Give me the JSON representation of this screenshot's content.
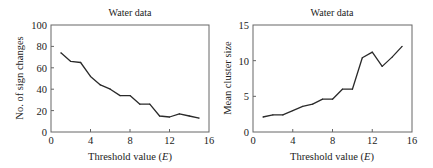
{
  "chart_data": [
    {
      "type": "line",
      "title": "Water data",
      "xlabel": "Threshold value (E)",
      "xlabel_parts": {
        "prefix": "Threshold value (",
        "var": "E",
        "suffix": ")"
      },
      "ylabel": "No. of sign changes",
      "xlim": [
        0,
        16
      ],
      "ylim": [
        0,
        100
      ],
      "xticks": [
        0,
        4,
        8,
        12,
        16
      ],
      "xtick_labels": [
        "0",
        "4",
        "8",
        "12",
        "16"
      ],
      "yticks": [
        0,
        20,
        40,
        60,
        80,
        100
      ],
      "ytick_labels": [
        "0",
        "20",
        "40",
        "60",
        "80",
        "100"
      ],
      "grid": false,
      "x": [
        1,
        2,
        3,
        4,
        5,
        6,
        7,
        8,
        9,
        10,
        11,
        12,
        13,
        14,
        15
      ],
      "series": [
        {
          "name": "No. of sign changes",
          "values": [
            74,
            66,
            65,
            52,
            44,
            40,
            34,
            34,
            26,
            26,
            15,
            14,
            17,
            15,
            13
          ]
        }
      ]
    },
    {
      "type": "line",
      "title": "Water data",
      "xlabel": "Threshold value (E)",
      "xlabel_parts": {
        "prefix": "Threshold value (",
        "var": "E",
        "suffix": ")"
      },
      "ylabel": "Mean cluster size",
      "xlim": [
        0,
        16
      ],
      "ylim": [
        0,
        15
      ],
      "xticks": [
        0,
        4,
        8,
        12,
        16
      ],
      "xtick_labels": [
        "0",
        "4",
        "8",
        "12",
        "16"
      ],
      "yticks": [
        0,
        5,
        10,
        15
      ],
      "ytick_labels": [
        "0",
        "5",
        "10",
        "15"
      ],
      "grid": false,
      "x": [
        1,
        2,
        3,
        4,
        5,
        6,
        7,
        8,
        9,
        10,
        11,
        12,
        13,
        14,
        15
      ],
      "series": [
        {
          "name": "Mean cluster size",
          "values": [
            2.1,
            2.4,
            2.4,
            3.0,
            3.6,
            3.9,
            4.6,
            4.6,
            6.0,
            6.0,
            10.4,
            11.2,
            9.2,
            10.5,
            12.0
          ]
        }
      ]
    }
  ]
}
